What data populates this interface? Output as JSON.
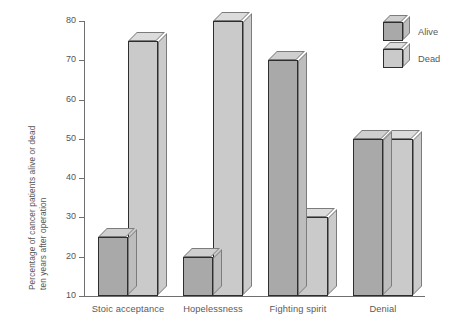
{
  "chart_data": {
    "type": "bar",
    "title": "",
    "subtitle": "",
    "xlabel": "",
    "ylabel": "Percentage of cancer patients alive or dead ten years after operation",
    "ylabel_lines": [
      "Percentage of cancer patients alive or dead",
      "ten years after operation"
    ],
    "categories": [
      "Stoic acceptance",
      "Hopelessness",
      "Fighting spirit",
      "Denial"
    ],
    "series": [
      {
        "name": "Alive",
        "values": [
          25,
          20,
          70,
          50
        ],
        "color": "#a9a9a9"
      },
      {
        "name": "Dead",
        "values": [
          75,
          80,
          30,
          50
        ],
        "color": "#cacaca"
      }
    ],
    "ylim": [
      10,
      80
    ],
    "ytick_labels": [
      "80",
      "70",
      "60",
      "50",
      "40",
      "30",
      "20",
      "10"
    ],
    "yticks": [
      80,
      70,
      60,
      50,
      40,
      30,
      20,
      10
    ],
    "grid": false,
    "legend_position": "top-right",
    "legend_entries": [
      "Alive",
      "Dead"
    ],
    "style": "3d-bars"
  },
  "legend": {
    "items": [
      {
        "label": "Alive",
        "icon": "cube-icon"
      },
      {
        "label": "Dead",
        "icon": "cube-icon"
      }
    ]
  },
  "axes": {
    "y_title_line1": "Percentage of cancer patients alive or dead",
    "y_title_line2": "ten years after operation",
    "y_ticks": [
      "80",
      "70",
      "60",
      "50",
      "40",
      "30",
      "20",
      "10"
    ],
    "x_labels": [
      "Stoic acceptance",
      "Hopelessness",
      "Fighting spirit",
      "Denial"
    ]
  }
}
